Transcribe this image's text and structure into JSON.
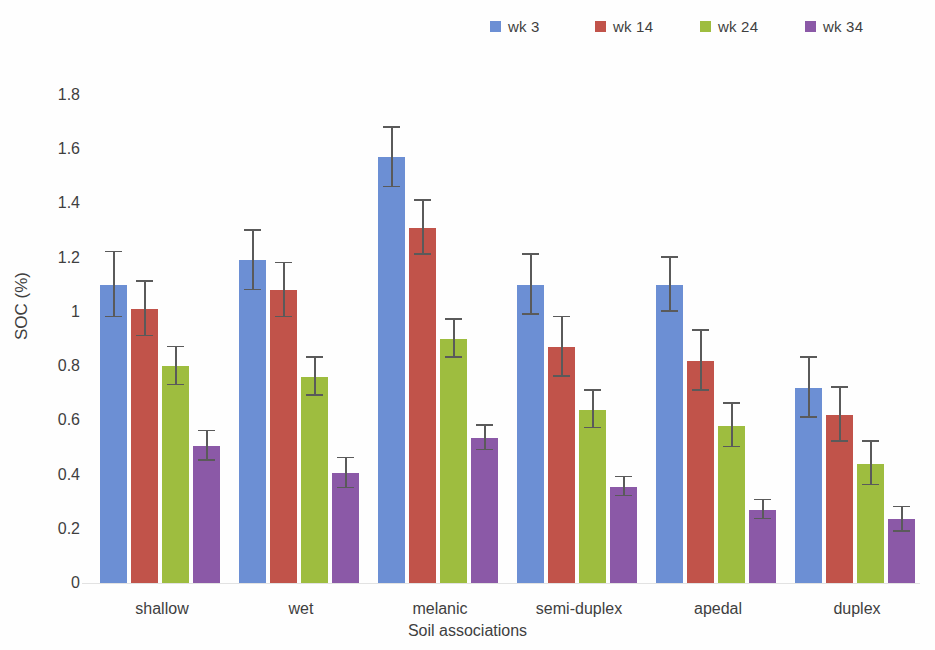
{
  "chart_data": {
    "type": "bar",
    "title": "",
    "xlabel": "Soil associations",
    "ylabel": "SOC (%)",
    "ylim": [
      0,
      1.8
    ],
    "yticks": [
      "1.8",
      "1.6",
      "1.4",
      "1.2",
      "1",
      "0.8",
      "0.6",
      "0.4",
      "0.2",
      "0"
    ],
    "ytick_values": [
      1.8,
      1.6,
      1.4,
      1.2,
      1.0,
      0.8,
      0.6,
      0.4,
      0.2,
      0
    ],
    "grid": false,
    "legend_position": "top-right",
    "categories": [
      "shallow",
      "wet",
      "melanic",
      "semi-duplex",
      "apedal",
      "duplex"
    ],
    "series": [
      {
        "name": "wk 3",
        "color": "#6c8fd4",
        "values": [
          1.1,
          1.19,
          1.57,
          1.1,
          1.1,
          0.72
        ],
        "errors": [
          0.12,
          0.11,
          0.11,
          0.11,
          0.1,
          0.11
        ]
      },
      {
        "name": "wk 14",
        "color": "#c1534a",
        "values": [
          1.01,
          1.08,
          1.31,
          0.87,
          0.82,
          0.62
        ],
        "errors": [
          0.1,
          0.1,
          0.1,
          0.11,
          0.11,
          0.1
        ]
      },
      {
        "name": "wk 24",
        "color": "#9ebd3f",
        "values": [
          0.8,
          0.76,
          0.9,
          0.64,
          0.58,
          0.44
        ],
        "errors": [
          0.07,
          0.07,
          0.07,
          0.07,
          0.08,
          0.08
        ]
      },
      {
        "name": "wk 34",
        "color": "#8b59a7",
        "values": [
          0.505,
          0.405,
          0.535,
          0.355,
          0.27,
          0.235
        ],
        "errors": [
          0.055,
          0.055,
          0.045,
          0.035,
          0.035,
          0.045
        ]
      }
    ]
  },
  "legend": {
    "items": [
      {
        "label": "wk 3"
      },
      {
        "label": "wk 14"
      },
      {
        "label": "wk 24"
      },
      {
        "label": "wk 34"
      }
    ]
  },
  "axes": {
    "y_title": "SOC (%)",
    "x_title": "Soil associations"
  }
}
